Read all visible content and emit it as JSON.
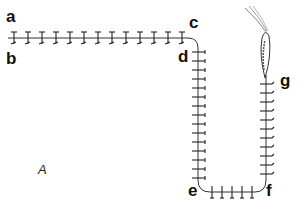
{
  "figure": {
    "panel_label": "A",
    "point_labels": {
      "a": "a",
      "b": "b",
      "c": "c",
      "d": "d",
      "e": "e",
      "f": "f",
      "g": "g"
    }
  }
}
